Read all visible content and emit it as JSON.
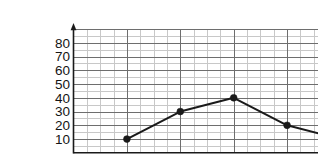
{
  "chart_data": {
    "type": "line",
    "title": "",
    "subtitle": "",
    "xlabel": "",
    "ylabel": "",
    "x": [
      1,
      2,
      3,
      4,
      5
    ],
    "values": [
      10,
      30,
      40,
      20,
      10
    ],
    "series": [
      {
        "name": "",
        "x": [
          1,
          2,
          3,
          4,
          5
        ],
        "values": [
          10,
          30,
          40,
          20,
          10
        ]
      }
    ],
    "points": [
      {
        "x": 1,
        "y": 10
      },
      {
        "x": 2,
        "y": 30
      },
      {
        "x": 3,
        "y": 40
      },
      {
        "x": 4,
        "y": 20
      },
      {
        "x": 5,
        "y": 10
      }
    ],
    "xlim": [
      0,
      5
    ],
    "ylim": [
      0,
      90
    ],
    "xticks": [
      0,
      1,
      2,
      3,
      4,
      5
    ],
    "yticks": [
      10,
      20,
      30,
      40,
      50,
      60,
      70,
      80
    ],
    "xtick_labels": [
      "0",
      "1",
      "2",
      "3",
      "4",
      "5"
    ],
    "ytick_labels": [
      "10",
      "20",
      "30",
      "40",
      "50",
      "60",
      "70",
      "80"
    ],
    "grid": true,
    "grid_minor": true,
    "grid_minor_step_x": 0.25,
    "grid_minor_step_y": 5,
    "legend": false,
    "legend_position": "none",
    "marker": "filled-circle",
    "line_color": "#1a1a1a",
    "marker_color": "#1a1a1a",
    "grid_color_major": "#6e6e6e",
    "grid_color_minor": "#c8c8c8",
    "axis_color": "#1a1a1a",
    "background_color": "#ffffff",
    "annotations": []
  },
  "axes": {
    "y_axis_name": "vertical-axis",
    "x_axis_name": "horizontal-axis",
    "y_arrow": "up-arrow",
    "x_arrow": "right-arrow"
  }
}
